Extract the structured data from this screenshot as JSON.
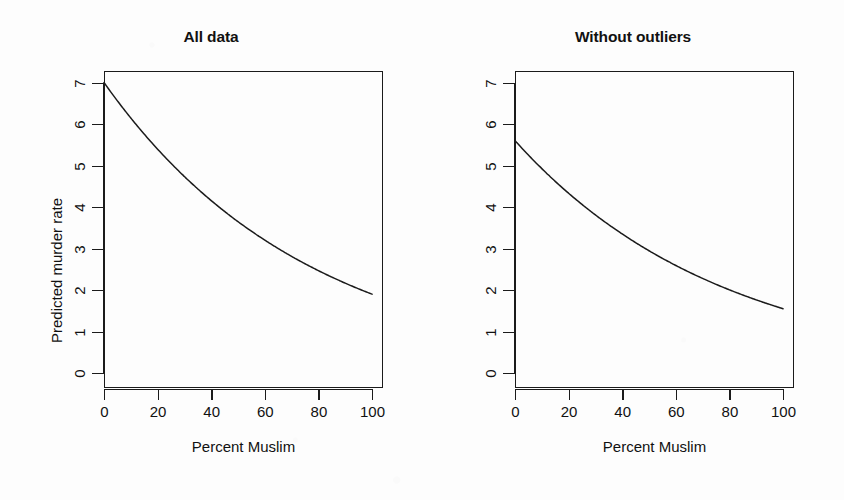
{
  "figure": {
    "background_color": "#fdfdfd",
    "ink_color": "#1b1b1b",
    "panel_count": 2
  },
  "panels": [
    {
      "title": "All data",
      "xlabel": "Percent Muslim",
      "ylabel": "Predicted murder rate",
      "xticks": [
        "0",
        "20",
        "40",
        "60",
        "80",
        "100"
      ],
      "yticks": [
        "0",
        "1",
        "2",
        "3",
        "4",
        "5",
        "6",
        "7"
      ]
    },
    {
      "title": "Without outliers",
      "xlabel": "Percent Muslim",
      "ylabel": "Predicted murder rate",
      "xticks": [
        "0",
        "20",
        "40",
        "60",
        "80",
        "100"
      ],
      "yticks": [
        "0",
        "1",
        "2",
        "3",
        "4",
        "5",
        "6",
        "7"
      ]
    }
  ],
  "chart_data": [
    {
      "type": "line",
      "title": "All data",
      "xlabel": "Percent Muslim",
      "ylabel": "Predicted murder rate",
      "xlim": [
        0,
        100
      ],
      "ylim": [
        0,
        7.4
      ],
      "xticks": [
        0,
        20,
        40,
        60,
        80,
        100
      ],
      "yticks": [
        0,
        1,
        2,
        3,
        4,
        5,
        6,
        7
      ],
      "grid": false,
      "legend": "none",
      "series": [
        {
          "name": "Predicted murder rate (all data)",
          "color": "#1b1b1b",
          "x": [
            0,
            5,
            10,
            15,
            20,
            25,
            30,
            35,
            40,
            45,
            50,
            55,
            60,
            65,
            70,
            75,
            80,
            85,
            90,
            95,
            100
          ],
          "values": [
            7.0,
            6.7,
            6.41,
            6.13,
            5.87,
            5.61,
            5.37,
            5.14,
            4.91,
            4.7,
            4.5,
            4.3,
            4.12,
            3.94,
            3.77,
            3.6,
            3.45,
            3.3,
            3.15,
            3.02,
            1.9
          ]
        }
      ]
    },
    {
      "type": "line",
      "title": "Without outliers",
      "xlabel": "Percent Muslim",
      "ylabel": "Predicted murder rate",
      "xlim": [
        0,
        100
      ],
      "ylim": [
        0,
        7.4
      ],
      "xticks": [
        0,
        20,
        40,
        60,
        80,
        100
      ],
      "yticks": [
        0,
        1,
        2,
        3,
        4,
        5,
        6,
        7
      ],
      "grid": false,
      "legend": "none",
      "series": [
        {
          "name": "Predicted murder rate (without outliers)",
          "color": "#1b1b1b",
          "x": [
            0,
            5,
            10,
            15,
            20,
            25,
            30,
            35,
            40,
            45,
            50,
            55,
            60,
            65,
            70,
            75,
            80,
            85,
            90,
            95,
            100
          ],
          "values": [
            5.6,
            5.4,
            5.2,
            5.0,
            4.7,
            4.45,
            4.2,
            3.98,
            3.75,
            3.55,
            3.35,
            3.18,
            3.0,
            2.85,
            2.7,
            2.55,
            2.35,
            2.15,
            1.95,
            1.75,
            1.55
          ]
        }
      ]
    }
  ]
}
